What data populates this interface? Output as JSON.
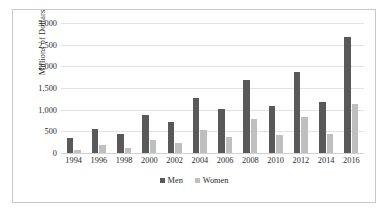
{
  "chart_data": {
    "type": "bar",
    "title": "",
    "xlabel": "",
    "ylabel": "Millions of Dollars",
    "ylim": [
      0,
      3000
    ],
    "ytick_labels": [
      "3,000",
      "2,500",
      "2,000",
      "1,500",
      "1,000",
      "500",
      "0"
    ],
    "ytick_values": [
      3000,
      2500,
      2000,
      1500,
      1000,
      500,
      0
    ],
    "grid": true,
    "legend_position": "bottom",
    "categories": [
      "1994",
      "1996",
      "1998",
      "2000",
      "2002",
      "2004",
      "2006",
      "2008",
      "2010",
      "2012",
      "2014",
      "2016"
    ],
    "series": [
      {
        "name": "Men",
        "color": "#595959",
        "values": [
          345,
          550,
          450,
          875,
          720,
          1270,
          1010,
          1680,
          1090,
          1880,
          1180,
          2680
        ]
      },
      {
        "name": "Women",
        "color": "#bfbfbf",
        "values": [
          80,
          175,
          115,
          300,
          230,
          520,
          375,
          790,
          405,
          835,
          440,
          1120
        ]
      }
    ]
  },
  "legend": {
    "items": [
      {
        "label": "Men",
        "swatch": "men-swatch"
      },
      {
        "label": "Women",
        "swatch": "women-swatch"
      }
    ]
  },
  "colors": {
    "men": "#595959",
    "women": "#bfbfbf",
    "gridline": "#e2e2e2",
    "frame_border": "#c9c9c9",
    "text": "#2b2b2b"
  }
}
